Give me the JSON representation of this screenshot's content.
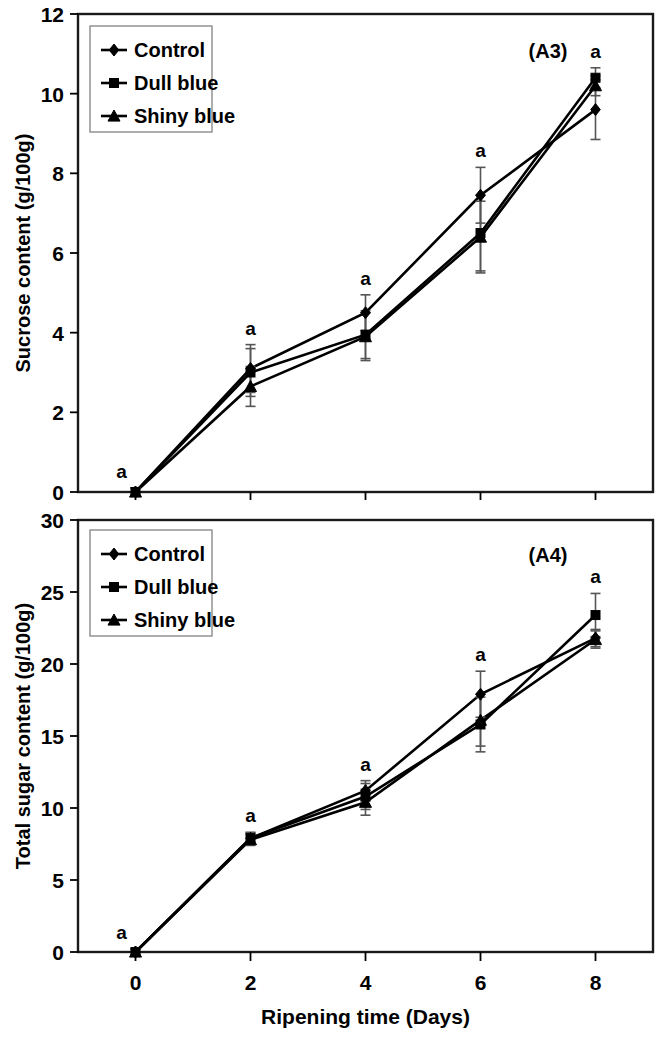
{
  "figure": {
    "x_axis_title": "Ripening time (Days)",
    "x_ticks": [
      "0",
      "2",
      "4",
      "6",
      "8"
    ]
  },
  "panels": [
    {
      "tag": "(A3)",
      "y_axis_title": "Sucrose content (g/100g)",
      "y_ticks": [
        "0",
        "2",
        "4",
        "6",
        "8",
        "10",
        "12"
      ],
      "legend": [
        {
          "label": "Control",
          "marker": "diamond-marker"
        },
        {
          "label": "Dull blue",
          "marker": "square-marker"
        },
        {
          "label": "Shiny blue",
          "marker": "triangle-marker"
        }
      ],
      "sig_letters": [
        "a",
        "a",
        "a",
        "a",
        "a"
      ]
    },
    {
      "tag": "(A4)",
      "y_axis_title": "Total sugar content (g/100g)",
      "y_ticks": [
        "0",
        "5",
        "10",
        "15",
        "20",
        "25",
        "30"
      ],
      "legend": [
        {
          "label": "Control",
          "marker": "diamond-marker"
        },
        {
          "label": "Dull blue",
          "marker": "square-marker"
        },
        {
          "label": "Shiny blue",
          "marker": "triangle-marker"
        }
      ],
      "sig_letters": [
        "a",
        "a",
        "a",
        "a",
        "a"
      ]
    }
  ],
  "chart_data": [
    {
      "type": "line",
      "title": "(A3)",
      "xlabel": "Ripening time (Days)",
      "ylabel": "Sucrose content (g/100g)",
      "x": [
        0,
        2,
        4,
        6,
        8
      ],
      "xlim": [
        -1,
        9
      ],
      "ylim": [
        0,
        12
      ],
      "ytick_step": 2,
      "grid": false,
      "legend_position": "top-left",
      "series": [
        {
          "name": "Control",
          "marker": "diamond",
          "values": [
            0.0,
            3.1,
            4.5,
            7.45,
            9.6
          ],
          "errors": [
            0.1,
            0.6,
            0.45,
            0.7,
            0.75
          ]
        },
        {
          "name": "Dull blue",
          "marker": "square",
          "values": [
            0.0,
            3.0,
            3.95,
            6.5,
            10.4
          ],
          "errors": [
            0.1,
            0.6,
            0.6,
            0.95,
            0.25
          ]
        },
        {
          "name": "Shiny blue",
          "marker": "triangle",
          "values": [
            0.0,
            2.65,
            3.9,
            6.4,
            10.2
          ],
          "errors": [
            0.1,
            0.5,
            0.6,
            0.9,
            0.25
          ]
        }
      ],
      "annotations": [
        "a",
        "a",
        "a",
        "a",
        "a"
      ]
    },
    {
      "type": "line",
      "title": "(A4)",
      "xlabel": "Ripening time (Days)",
      "ylabel": "Total sugar content (g/100g)",
      "x": [
        0,
        2,
        4,
        6,
        8
      ],
      "xlim": [
        -1,
        9
      ],
      "ylim": [
        0,
        30
      ],
      "ytick_step": 5,
      "grid": false,
      "legend_position": "top-left",
      "series": [
        {
          "name": "Control",
          "marker": "diamond",
          "values": [
            0.0,
            7.9,
            11.2,
            17.9,
            21.8
          ],
          "errors": [
            0.2,
            0.4,
            0.7,
            1.6,
            0.6
          ]
        },
        {
          "name": "Dull blue",
          "marker": "square",
          "values": [
            0.0,
            7.9,
            10.8,
            15.8,
            23.4
          ],
          "errors": [
            0.2,
            0.4,
            0.9,
            1.9,
            1.5
          ]
        },
        {
          "name": "Shiny blue",
          "marker": "triangle",
          "values": [
            0.0,
            7.8,
            10.4,
            16.1,
            21.7
          ],
          "errors": [
            0.2,
            0.4,
            0.9,
            1.8,
            0.6
          ]
        }
      ],
      "annotations": [
        "a",
        "a",
        "a",
        "a",
        "a"
      ]
    }
  ]
}
